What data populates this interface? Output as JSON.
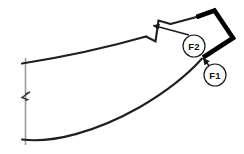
{
  "figure": {
    "type": "engineering-cross-section-drawing",
    "title": "",
    "background_color": "#ffffff",
    "line_color": "#1a1a1a",
    "thick_line_color": "#000000",
    "break_line_color": "#8c8c8c",
    "callout_circle_fill": "#ffffff",
    "callouts": [
      {
        "id": "F2",
        "label": "F2",
        "center_x": 194,
        "center_y": 46,
        "radius": 11
      },
      {
        "id": "F1",
        "label": "F1",
        "center_x": 215,
        "center_y": 75,
        "radius": 11
      }
    ],
    "leaders": [
      {
        "id": "f2-leader",
        "from_x": 189,
        "from_y": 36,
        "to_x": 151,
        "to_y": 26,
        "arrow": "to-end"
      },
      {
        "id": "f1-leader",
        "from_x": 210,
        "from_y": 66,
        "to_x": 203,
        "to_y": 57,
        "arrow": "to-end"
      }
    ],
    "geometry": {
      "break_line": {
        "x": 25,
        "y_top": 58,
        "y_bottom": 145
      },
      "upper_curve_start": {
        "x": 25,
        "y": 63
      },
      "lower_curve_start": {
        "x": 25,
        "y": 140
      },
      "notch_x": 155,
      "notch_depth_y": 41,
      "thick_apex": {
        "x": 214,
        "y": 11
      },
      "thick_right": {
        "x": 233,
        "y": 38
      },
      "thick_bottom": {
        "x": 203,
        "y": 58
      }
    }
  }
}
